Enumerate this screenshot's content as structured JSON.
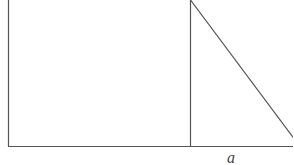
{
  "diagram": {
    "stroke_color": "#555555",
    "background": "#ffffff",
    "labels": {
      "base_segment": "a"
    },
    "shapes": {
      "rectangle": {
        "x1": 8,
        "y1": 0,
        "x2": 190,
        "y2": 146
      },
      "triangle": {
        "points": [
          [
            190,
            0
          ],
          [
            190,
            146
          ],
          [
            293,
            146
          ]
        ]
      }
    }
  }
}
